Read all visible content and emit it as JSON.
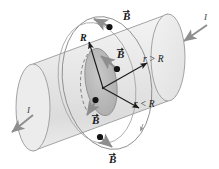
{
  "figure": {
    "name": "magnetic-field-of-current-carrying-cylindrical-conductor",
    "type": "physics-diagram",
    "background_color": "#ffffff"
  },
  "colors": {
    "cylinder_fill": "#e8e8e8",
    "cylinder_fill_light": "#f1f1f1",
    "cylinder_stroke": "#9a9a9a",
    "inner_disk_fill": "#b9b9b9",
    "inner_disk_stroke": "#8a8a8a",
    "field_line_stroke": "#8d8d8d",
    "vector_gray": "#8e8e8e",
    "point_black": "#141414",
    "arrow_black": "#1c1c1c",
    "text_color": "#171717",
    "current_arrow": "#8e8e8e"
  },
  "labels": {
    "b_top": "B",
    "b_inner": "B",
    "b_lower_left": "B",
    "b_bottom": "B",
    "radius_R": "R",
    "current_right": "I",
    "current_left": "I",
    "r_outside": "r > R",
    "r_inside": "r < R"
  },
  "annotations": {
    "vector_symbol": "arrow-over-letter",
    "field_points_count": 4,
    "current_arrows_count": 2,
    "radius_arrows_count": 2,
    "field_line_circles": 2,
    "cylinder_ends": 2
  }
}
